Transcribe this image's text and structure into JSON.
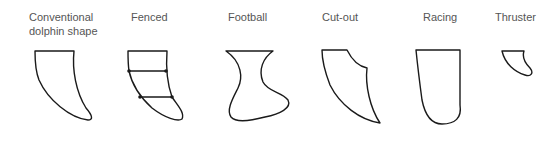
{
  "fins": [
    {
      "id": "conventional",
      "label_line1": "Conventional",
      "label_line2": "dolphin shape"
    },
    {
      "id": "fenced",
      "label": "Fenced"
    },
    {
      "id": "football",
      "label": "Football"
    },
    {
      "id": "cutout",
      "label": "Cut-out"
    },
    {
      "id": "racing",
      "label": "Racing"
    },
    {
      "id": "thruster",
      "label": "Thruster"
    }
  ],
  "colors": {
    "stroke": "#1a1a1a",
    "label": "#555555",
    "background": "#ffffff"
  }
}
